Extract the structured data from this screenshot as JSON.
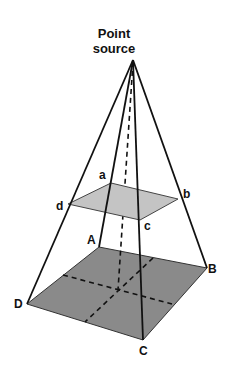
{
  "title": {
    "line1": "Point",
    "line2": "source"
  },
  "labels": {
    "upper": {
      "a": "a",
      "b": "b",
      "c": "c",
      "d": "d"
    },
    "lower": {
      "A": "A",
      "B": "B",
      "C": "C",
      "D": "D"
    }
  },
  "colors": {
    "upper_plane": "#c4c4c4",
    "lower_plane": "#8a8a8a",
    "lines": "#111111"
  }
}
